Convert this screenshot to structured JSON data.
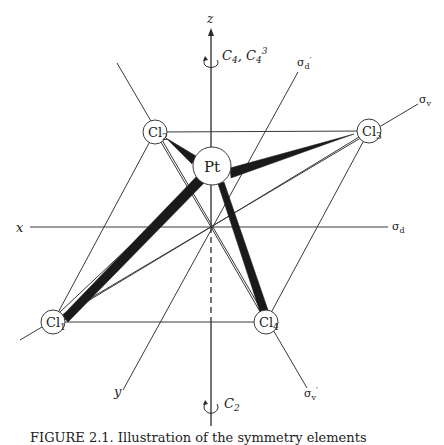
{
  "figure": {
    "central_atom": "Pt",
    "ligands": [
      {
        "id": "Cl1",
        "element": "Cl",
        "sub": "1"
      },
      {
        "id": "Cl2",
        "element": "Cl",
        "sub": "2"
      },
      {
        "id": "Cl3",
        "element": "Cl",
        "sub": "3"
      },
      {
        "id": "Cl4",
        "element": "Cl",
        "sub": "4"
      }
    ],
    "axes": {
      "x": "x",
      "y": "y",
      "z": "z"
    },
    "rotation_axes": {
      "top": {
        "main": "C",
        "sub1": "4",
        "sep": ", ",
        "main2": "C",
        "sub2": "4",
        "sup2": "3"
      },
      "bottom": {
        "main": "C",
        "sub": "2"
      }
    },
    "planes": {
      "sigma_d": {
        "sym": "σ",
        "sub": "d"
      },
      "sigma_d_prime": {
        "sym": "σ",
        "sub": "d",
        "prime": "′"
      },
      "sigma_v": {
        "sym": "σ",
        "sub": "v"
      },
      "sigma_v_prime": {
        "sym": "σ",
        "sub": "v",
        "prime": "′"
      }
    },
    "caption": "FIGURE 2.1. Illustration of the symmetry elements"
  }
}
